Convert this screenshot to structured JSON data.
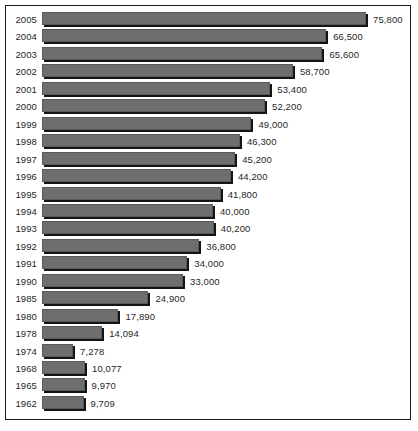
{
  "chart_data": {
    "type": "bar",
    "orientation": "horizontal",
    "title": "",
    "subtitle": "",
    "xlabel": "",
    "ylabel": "",
    "grid": false,
    "legend": null,
    "xlim": [
      0,
      75800
    ],
    "categories": [
      "2005",
      "2004",
      "2003",
      "2002",
      "2001",
      "2000",
      "1999",
      "1998",
      "1997",
      "1996",
      "1995",
      "1994",
      "1993",
      "1992",
      "1991",
      "1990",
      "1985",
      "1980",
      "1978",
      "1974",
      "1968",
      "1965",
      "1962"
    ],
    "values": [
      75800,
      66500,
      65600,
      58700,
      53400,
      52200,
      49000,
      46300,
      45200,
      44200,
      41800,
      40000,
      40200,
      36800,
      34000,
      33000,
      24900,
      17890,
      14094,
      7278,
      10077,
      9970,
      9709
    ],
    "value_labels": [
      "75,800",
      "66,500",
      "65,600",
      "58,700",
      "53,400",
      "52,200",
      "49,000",
      "46,300",
      "45,200",
      "44,200",
      "41,800",
      "40,000",
      "40,200",
      "36,800",
      "34,000",
      "33,000",
      "24,900",
      "17,890",
      "14,094",
      "7,278",
      "10,077",
      "9,970",
      "9,709"
    ],
    "bars": [
      {
        "category": "2005",
        "value": 75800,
        "label": "75,800"
      },
      {
        "category": "2004",
        "value": 66500,
        "label": "66,500"
      },
      {
        "category": "2003",
        "value": 65600,
        "label": "65,600"
      },
      {
        "category": "2002",
        "value": 58700,
        "label": "58,700"
      },
      {
        "category": "2001",
        "value": 53400,
        "label": "53,400"
      },
      {
        "category": "2000",
        "value": 52200,
        "label": "52,200"
      },
      {
        "category": "1999",
        "value": 49000,
        "label": "49,000"
      },
      {
        "category": "1998",
        "value": 46300,
        "label": "46,300"
      },
      {
        "category": "1997",
        "value": 45200,
        "label": "45,200"
      },
      {
        "category": "1996",
        "value": 44200,
        "label": "44,200"
      },
      {
        "category": "1995",
        "value": 41800,
        "label": "41,800"
      },
      {
        "category": "1994",
        "value": 40000,
        "label": "40,000"
      },
      {
        "category": "1993",
        "value": 40200,
        "label": "40,200"
      },
      {
        "category": "1992",
        "value": 36800,
        "label": "36,800"
      },
      {
        "category": "1991",
        "value": 34000,
        "label": "34,000"
      },
      {
        "category": "1990",
        "value": 33000,
        "label": "33,000"
      },
      {
        "category": "1985",
        "value": 24900,
        "label": "24,900"
      },
      {
        "category": "1980",
        "value": 17890,
        "label": "17,890"
      },
      {
        "category": "1978",
        "value": 14094,
        "label": "14,094"
      },
      {
        "category": "1974",
        "value": 7278,
        "label": "7,278"
      },
      {
        "category": "1968",
        "value": 10077,
        "label": "10,077"
      },
      {
        "category": "1965",
        "value": 9970,
        "label": "9,970"
      },
      {
        "category": "1962",
        "value": 9709,
        "label": "9,709"
      }
    ],
    "colors": {
      "bar_fill": "#6e6e6e",
      "bar_shadow": "#141414",
      "frame_border": "#1a1a1a",
      "text": "#1f1f1f",
      "background": "#ffffff"
    }
  }
}
